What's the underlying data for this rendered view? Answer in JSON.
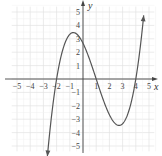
{
  "chart_data": {
    "type": "line",
    "title": "",
    "xlabel": "x",
    "ylabel": "y",
    "xlim": [
      -5.5,
      5.5
    ],
    "ylim": [
      -5.5,
      5.5
    ],
    "grid": true,
    "x_ticks": [
      "-5",
      "-4",
      "-3",
      "-2",
      "-1",
      "1",
      "2",
      "3",
      "4",
      "5"
    ],
    "y_ticks": [
      "5",
      "4",
      "3",
      "2",
      "1",
      "-1",
      "-2",
      "-3",
      "-4",
      "-5"
    ],
    "series": [
      {
        "name": "f(x)",
        "description": "cubic polynomial with zeros at x=-2, 1, 4; local max near (-0.7, 3.1); local min near (2.7, -3.1); y-intercept about 2.7; arrows at both ends",
        "zeros": [
          -2,
          1,
          4
        ],
        "x": [
          -2.7,
          -2,
          -1.5,
          -1,
          -0.7,
          0,
          0.5,
          1,
          1.5,
          2,
          2.5,
          2.7,
          3,
          3.5,
          4,
          4.3,
          4.6
        ],
        "y": [
          -5.0,
          0,
          2.2,
          3.3,
          3.4,
          2.67,
          1.3,
          0,
          -1.5,
          -2.67,
          -3.1,
          -3.1,
          -2.9,
          -2.1,
          0,
          1.9,
          4.8
        ]
      }
    ]
  }
}
